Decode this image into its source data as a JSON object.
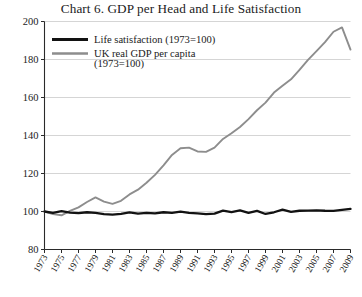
{
  "chart_data": {
    "type": "line",
    "title": "Chart 6. GDP per Head and Life Satisfaction",
    "xlabel": "",
    "ylabel": "",
    "xlim": [
      1973,
      2009
    ],
    "ylim": [
      80,
      200
    ],
    "grid": true,
    "grid_axis": "y",
    "legend_position": "top-left",
    "y_ticks": [
      80,
      100,
      120,
      140,
      160,
      180,
      200
    ],
    "x_ticks": [
      1973,
      1975,
      1977,
      1979,
      1981,
      1983,
      1985,
      1987,
      1989,
      1991,
      1993,
      1995,
      1997,
      1999,
      2001,
      2003,
      2005,
      2007,
      2009
    ],
    "x": [
      1973,
      1974,
      1975,
      1976,
      1977,
      1978,
      1979,
      1980,
      1981,
      1982,
      1983,
      1984,
      1985,
      1986,
      1987,
      1988,
      1989,
      1990,
      1991,
      1992,
      1993,
      1994,
      1995,
      1996,
      1997,
      1998,
      1999,
      2000,
      2001,
      2002,
      2003,
      2004,
      2005,
      2006,
      2007,
      2008,
      2009
    ],
    "series": [
      {
        "name": "Life satisfaction (1973=100)",
        "color": "#121212",
        "values": [
          100.0,
          99.3,
          100.2,
          99.4,
          99.1,
          99.6,
          99.3,
          98.6,
          98.4,
          98.8,
          99.5,
          98.9,
          99.3,
          99.0,
          99.6,
          99.3,
          99.9,
          99.3,
          99.0,
          98.6,
          98.9,
          100.5,
          99.7,
          100.6,
          99.3,
          100.3,
          98.7,
          99.6,
          101.0,
          99.8,
          100.4,
          100.5,
          100.6,
          100.4,
          100.3,
          100.8,
          101.4
        ]
      },
      {
        "name": "UK real GDP per capita (1973=100)",
        "color": "#8d8d8d",
        "values": [
          100.0,
          98.6,
          98.0,
          100.3,
          102.2,
          105.0,
          107.4,
          105.2,
          104.0,
          105.6,
          109.0,
          111.5,
          115.1,
          119.3,
          124.3,
          129.8,
          133.3,
          133.6,
          131.6,
          131.4,
          133.6,
          138.2,
          141.2,
          144.5,
          148.6,
          153.3,
          157.3,
          162.6,
          166.2,
          169.6,
          174.6,
          179.8,
          184.4,
          189.1,
          194.6,
          196.9,
          185.2
        ]
      }
    ],
    "legend": [
      {
        "label": "Life satisfaction (1973=100)",
        "color": "#121212"
      },
      {
        "label": "UK real GDP per capita",
        "label2": "(1973=100)",
        "color": "#8d8d8d"
      }
    ]
  }
}
